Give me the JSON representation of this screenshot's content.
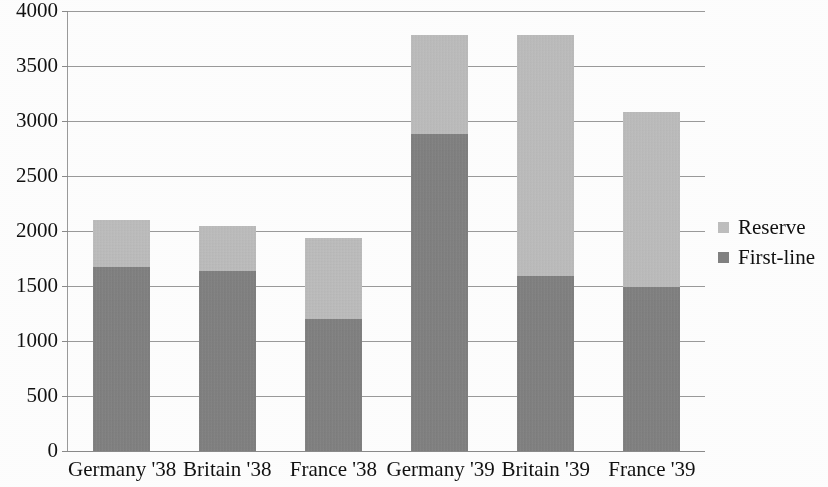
{
  "chart_data": {
    "type": "bar",
    "subtype": "stacked-bar",
    "title": "",
    "xlabel": "",
    "ylabel": "",
    "ylim": [
      0,
      4000
    ],
    "y_ticks": [
      0,
      500,
      1000,
      1500,
      2000,
      2500,
      3000,
      3500,
      4000
    ],
    "y_tick_labels": [
      "0",
      "500",
      "1000",
      "1500",
      "2000",
      "2500",
      "3000",
      "3500",
      "4000"
    ],
    "grid": true,
    "legend_position": "right",
    "categories": [
      "Germany '38",
      "Britain '38",
      "France '38",
      "Germany '39",
      "Britain '39",
      "France '39"
    ],
    "series": [
      {
        "name": "First-line",
        "color": "#818181",
        "values": [
          1670,
          1640,
          1200,
          2880,
          1590,
          1490
        ]
      },
      {
        "name": "Reserve",
        "color": "#bebebe",
        "values": [
          430,
          410,
          740,
          900,
          2190,
          1590
        ]
      }
    ],
    "totals": [
      2100,
      2050,
      1940,
      3780,
      3780,
      3080
    ],
    "stack_order": [
      "First-line",
      "Reserve"
    ]
  },
  "legend": {
    "entries": [
      {
        "label": "Reserve",
        "color": "#bebebe"
      },
      {
        "label": "First-line",
        "color": "#818181"
      }
    ]
  },
  "colors": {
    "reserve": "#bebebe",
    "first_line": "#818181",
    "grid": "#9a9a9a",
    "text": "#111111",
    "background": "#fdfdfd"
  }
}
